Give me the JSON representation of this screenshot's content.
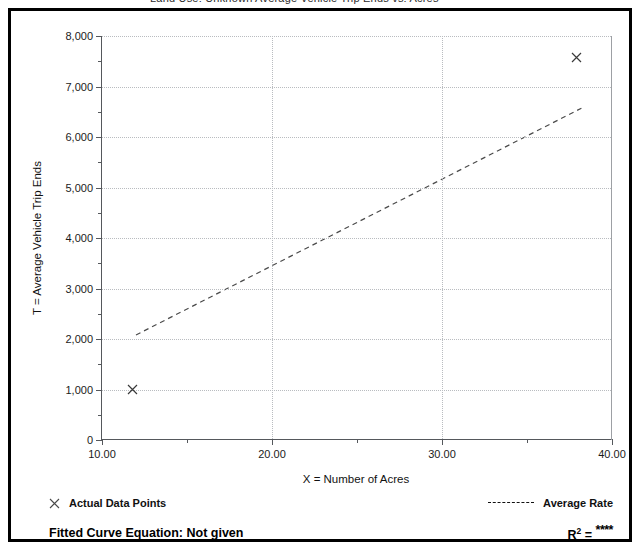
{
  "figure": {
    "clipped_header_text": "Land Use: Unknown    Average Vehicle Trip Ends vs: Acres"
  },
  "chart_data": {
    "type": "scatter",
    "title": "",
    "xlabel": "X = Number of Acres",
    "ylabel": "T = Average Vehicle Trip Ends",
    "xlim": [
      10.0,
      40.0
    ],
    "ylim": [
      0,
      8000
    ],
    "xticks": [
      10.0,
      15.0,
      20.0,
      25.0,
      30.0,
      35.0,
      40.0
    ],
    "xtick_labels": [
      "10.00",
      "",
      "20.00",
      "",
      "30.00",
      "",
      "40.00"
    ],
    "yticks": [
      0,
      500,
      1000,
      1500,
      2000,
      2500,
      3000,
      3500,
      4000,
      4500,
      5000,
      5500,
      6000,
      6500,
      7000,
      7500,
      8000
    ],
    "ytick_labels": [
      "0",
      "",
      "1,000",
      "",
      "2,000",
      "",
      "3,000",
      "",
      "4,000",
      "",
      "5,000",
      "",
      "6,000",
      "",
      "7,000",
      "",
      "8,000"
    ],
    "grid": "dotted-both",
    "gridlines_x": [
      20.0,
      30.0
    ],
    "gridlines_y": [
      1000,
      2000,
      3000,
      4000,
      5000,
      6000,
      7000,
      8000
    ],
    "series": [
      {
        "name": "Actual Data Points",
        "type": "scatter",
        "marker": "x",
        "points": [
          {
            "x": 11.8,
            "y": 1000
          },
          {
            "x": 37.9,
            "y": 7580
          }
        ]
      },
      {
        "name": "Average Rate",
        "type": "line",
        "style": "dashed",
        "points": [
          {
            "x": 12.0,
            "y": 2080
          },
          {
            "x": 38.2,
            "y": 6570
          }
        ]
      }
    ],
    "legend_position": "below-axes"
  },
  "legend": {
    "data_points_label": "Actual Data Points",
    "data_points_marker": "x-marker-icon",
    "average_rate_label": "Average Rate",
    "average_rate_marker": "dashed-line-icon",
    "fitted_curve_label": "Fitted Curve Equation:  Not given",
    "r_squared_symbol": "R",
    "r_squared_exponent": "2",
    "r_squared_equals": "=",
    "r_squared_value": "****"
  }
}
